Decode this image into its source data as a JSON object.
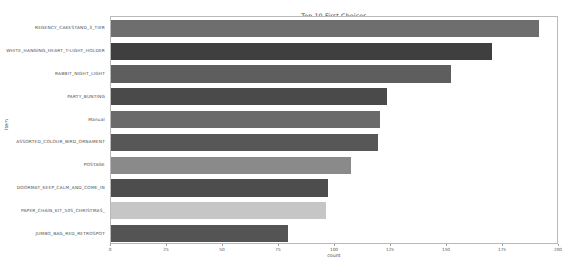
{
  "figure": {
    "top_caption": "",
    "title": "Top 10 First Choices",
    "xlabel": "count",
    "ylabel": "Item"
  },
  "chart_data": {
    "type": "bar",
    "orientation": "horizontal",
    "title": "Top 10 First Choices",
    "xlabel": "count",
    "ylabel": "Item",
    "grid": false,
    "legend": "none",
    "xlim": [
      0,
      200
    ],
    "xticks": [
      0,
      25,
      50,
      75,
      100,
      125,
      150,
      175,
      200
    ],
    "xticklabels": [
      "0",
      "25",
      "50",
      "75",
      "100",
      "125",
      "150",
      "175",
      "200"
    ],
    "categories": [
      "REGENCY_CAKESTAND_3_TIER",
      "WHITE_HANGING_HEART_T-LIGHT_HOLDER",
      "RABBIT_NIGHT_LIGHT",
      "PARTY_BUNTING",
      "Manual",
      "ASSORTED_COLOUR_BIRD_ORNAMENT",
      "POSTAGE",
      "DOORMAT_KEEP_CALM_AND_COME_IN",
      "PAPER_CHAIN_KIT_50S_CHRISTMAS_",
      "JUMBO_BAG_RED_RETROSPOT"
    ],
    "values": [
      191,
      170,
      152,
      123,
      120,
      119,
      107,
      97,
      96,
      79
    ],
    "colors": [
      "#6e6e6e",
      "#3f3f3f",
      "#5e5e5e",
      "#4a4a4a",
      "#6a6a6a",
      "#575757",
      "#8a8a8a",
      "#4d4d4d",
      "#c6c6c6",
      "#545454"
    ]
  }
}
